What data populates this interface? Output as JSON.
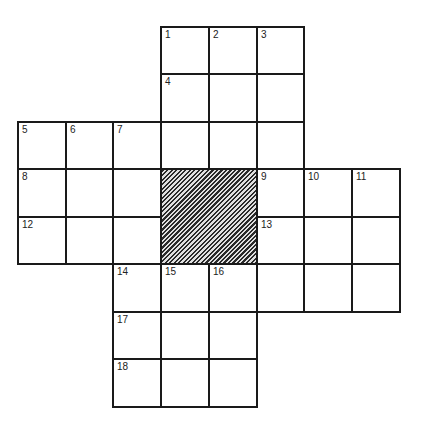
{
  "puzzle": {
    "type": "crossword",
    "grid_shape": "plus",
    "columns": 8,
    "rows": 8,
    "cells": [
      {
        "row": 0,
        "col": 3,
        "number": "1"
      },
      {
        "row": 0,
        "col": 4,
        "number": "2"
      },
      {
        "row": 0,
        "col": 5,
        "number": "3"
      },
      {
        "row": 1,
        "col": 3,
        "number": "4"
      },
      {
        "row": 1,
        "col": 4,
        "number": ""
      },
      {
        "row": 1,
        "col": 5,
        "number": ""
      },
      {
        "row": 2,
        "col": 0,
        "number": "5"
      },
      {
        "row": 2,
        "col": 1,
        "number": "6"
      },
      {
        "row": 2,
        "col": 2,
        "number": "7"
      },
      {
        "row": 2,
        "col": 3,
        "number": ""
      },
      {
        "row": 2,
        "col": 4,
        "number": ""
      },
      {
        "row": 2,
        "col": 5,
        "number": ""
      },
      {
        "row": 3,
        "col": 0,
        "number": "8"
      },
      {
        "row": 3,
        "col": 1,
        "number": ""
      },
      {
        "row": 3,
        "col": 2,
        "number": ""
      },
      {
        "row": 3,
        "col": 5,
        "number": "9"
      },
      {
        "row": 3,
        "col": 6,
        "number": "10"
      },
      {
        "row": 3,
        "col": 7,
        "number": "11"
      },
      {
        "row": 4,
        "col": 0,
        "number": "12"
      },
      {
        "row": 4,
        "col": 1,
        "number": ""
      },
      {
        "row": 4,
        "col": 2,
        "number": ""
      },
      {
        "row": 4,
        "col": 5,
        "number": "13"
      },
      {
        "row": 4,
        "col": 6,
        "number": ""
      },
      {
        "row": 4,
        "col": 7,
        "number": ""
      },
      {
        "row": 5,
        "col": 2,
        "number": "14"
      },
      {
        "row": 5,
        "col": 3,
        "number": "15"
      },
      {
        "row": 5,
        "col": 4,
        "number": "16"
      },
      {
        "row": 5,
        "col": 5,
        "number": ""
      },
      {
        "row": 5,
        "col": 6,
        "number": ""
      },
      {
        "row": 5,
        "col": 7,
        "number": ""
      },
      {
        "row": 6,
        "col": 2,
        "number": "17"
      },
      {
        "row": 6,
        "col": 3,
        "number": ""
      },
      {
        "row": 6,
        "col": 4,
        "number": ""
      },
      {
        "row": 7,
        "col": 2,
        "number": "18"
      },
      {
        "row": 7,
        "col": 3,
        "number": ""
      },
      {
        "row": 7,
        "col": 4,
        "number": ""
      }
    ],
    "blocks": [
      {
        "row": 3,
        "col": 3,
        "rowspan": 2,
        "colspan": 2
      }
    ]
  },
  "colors": {
    "grid_line": "#1a1a1a",
    "cell_fill": "#ffffff",
    "block_hatch": "#2a2a2a"
  }
}
